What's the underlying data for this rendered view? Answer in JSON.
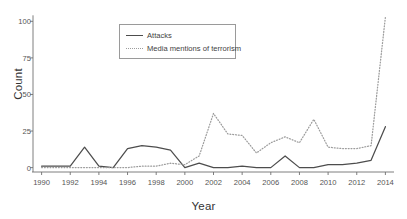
{
  "chart_data": {
    "type": "line",
    "title": "",
    "xlabel": "Year",
    "ylabel": "Count",
    "xlim": [
      1989.4,
      2014.6
    ],
    "ylim": [
      -3,
      105
    ],
    "grid": false,
    "legend_position": "upper-center-left",
    "x": [
      1990,
      1991,
      1992,
      1993,
      1994,
      1995,
      1996,
      1997,
      1998,
      1999,
      2000,
      2001,
      2002,
      2003,
      2004,
      2005,
      2006,
      2007,
      2008,
      2009,
      2010,
      2011,
      2012,
      2013,
      2014
    ],
    "xticks": [
      1990,
      1992,
      1994,
      1996,
      1998,
      2000,
      2002,
      2004,
      2006,
      2008,
      2010,
      2012,
      2014
    ],
    "xtick_labels": [
      "1990",
      "1992",
      "1994",
      "1996",
      "1998",
      "2000",
      "2002",
      "2004",
      "2006",
      "2008",
      "2010",
      "2012",
      "2014"
    ],
    "yticks": [
      0,
      25,
      50,
      75,
      100
    ],
    "ytick_labels": [
      "0",
      "25",
      "50",
      "75",
      "100"
    ],
    "series": [
      {
        "name": "Attacks",
        "style": "solid",
        "color": "#4d4d4d",
        "values": [
          1,
          1,
          1,
          14,
          1,
          0,
          13,
          15,
          14,
          12,
          0,
          3,
          0,
          0,
          1,
          0,
          0,
          8,
          0,
          0,
          2,
          2,
          3,
          5,
          28
        ]
      },
      {
        "name": "Media mentions of terrorism",
        "style": "dotted",
        "color": "#9c9c9c",
        "values": [
          0,
          0,
          0,
          0,
          0,
          0,
          0,
          1,
          1,
          3,
          2,
          8,
          37,
          23,
          22,
          10,
          17,
          21,
          17,
          33,
          14,
          13,
          13,
          15,
          103
        ]
      }
    ]
  },
  "legend": {
    "items": [
      {
        "label": "Attacks",
        "style": "solid"
      },
      {
        "label": "Media mentions of terrorism",
        "style": "dotted"
      }
    ]
  },
  "axes": {
    "y_title": "Count",
    "x_title": "Year"
  }
}
